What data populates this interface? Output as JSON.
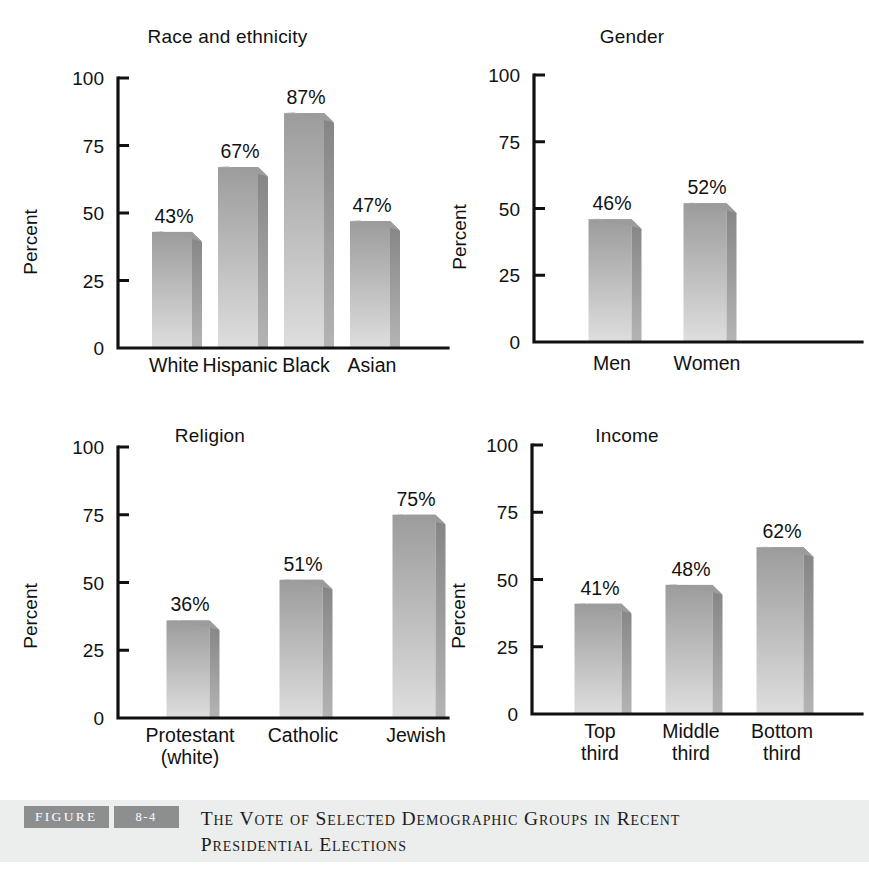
{
  "figure": {
    "badge_label": "FIGURE",
    "number_label": "8-4",
    "caption": "The Vote of Selected Demographic Groups in Recent Presidential Elections",
    "band_color": "#eceded",
    "badge_color": "#8d8e90"
  },
  "style": {
    "bar_top_color": "#9c9c9c",
    "bar_bottom_color": "#dedede",
    "bar_side_top_color": "#848484",
    "bar_side_bottom_color": "#b4b4b4",
    "axis_color": "#111111"
  },
  "chart_data": [
    {
      "type": "bar",
      "title": "Race and ethnicity",
      "xlabel": "",
      "ylabel": "Percent",
      "ylim": [
        0,
        100
      ],
      "yticks": [
        0,
        25,
        50,
        75,
        100
      ],
      "ytick_labels": [
        "0",
        "25",
        "50",
        "75",
        "100"
      ],
      "grid": false,
      "legend": "none",
      "categories": [
        "White",
        "Hispanic",
        "Black",
        "Asian"
      ],
      "values": [
        43,
        67,
        87,
        47
      ],
      "value_labels": [
        "43%",
        "67%",
        "87%",
        "47%"
      ]
    },
    {
      "type": "bar",
      "title": "Gender",
      "xlabel": "",
      "ylabel": "Percent",
      "ylim": [
        0,
        100
      ],
      "yticks": [
        0,
        25,
        50,
        75,
        100
      ],
      "ytick_labels": [
        "0",
        "25",
        "50",
        "75",
        "100"
      ],
      "grid": false,
      "legend": "none",
      "categories": [
        "Men",
        "Women"
      ],
      "values": [
        46,
        52
      ],
      "value_labels": [
        "46%",
        "52%"
      ]
    },
    {
      "type": "bar",
      "title": "Religion",
      "xlabel": "",
      "ylabel": "Percent",
      "ylim": [
        0,
        100
      ],
      "yticks": [
        0,
        25,
        50,
        75,
        100
      ],
      "ytick_labels": [
        "0",
        "25",
        "50",
        "75",
        "100"
      ],
      "grid": false,
      "legend": "none",
      "categories": [
        "Protestant\n(white)",
        "Catholic",
        "Jewish"
      ],
      "values": [
        36,
        51,
        75
      ],
      "value_labels": [
        "36%",
        "51%",
        "75%"
      ]
    },
    {
      "type": "bar",
      "title": "Income",
      "xlabel": "",
      "ylabel": "Percent",
      "ylim": [
        0,
        100
      ],
      "yticks": [
        0,
        25,
        50,
        75,
        100
      ],
      "ytick_labels": [
        "0",
        "25",
        "50",
        "75",
        "100"
      ],
      "grid": false,
      "legend": "none",
      "categories": [
        "Top\nthird",
        "Middle\nthird",
        "Bottom\nthird"
      ],
      "values": [
        41,
        48,
        62
      ],
      "value_labels": [
        "41%",
        "48%",
        "62%"
      ]
    }
  ],
  "panels": [
    {
      "name": "race-and-ethnicity",
      "left": 0,
      "top": 26,
      "width": 455,
      "height": 390,
      "plot": {
        "x0": 118,
        "y0": 348,
        "y100": 78,
        "bar_width": 40,
        "depth": 10,
        "first_center": 172,
        "step": 66,
        "label_y": 372,
        "label_y2": 394
      }
    },
    {
      "name": "gender",
      "left": 452,
      "top": 26,
      "width": 417,
      "height": 390,
      "plot": {
        "x0": 82,
        "y0": 342,
        "y100": 75,
        "bar_width": 43,
        "depth": 10,
        "first_center": 158,
        "step": 95,
        "label_y": 370,
        "label_y2": 392
      }
    },
    {
      "name": "religion",
      "left": 0,
      "top": 425,
      "width": 455,
      "height": 390,
      "plot": {
        "x0": 118,
        "y0": 718,
        "y100": 447,
        "bar_width": 43,
        "depth": 10,
        "first_center": 188,
        "step": 113,
        "label_y": 742,
        "label_y2": 764
      }
    },
    {
      "name": "income",
      "left": 452,
      "top": 425,
      "width": 417,
      "height": 390,
      "plot": {
        "x0": 80,
        "y0": 714,
        "y100": 445,
        "bar_width": 47,
        "depth": 10,
        "first_center": 146,
        "step": 91,
        "label_y": 738,
        "label_y2": 760
      }
    }
  ]
}
